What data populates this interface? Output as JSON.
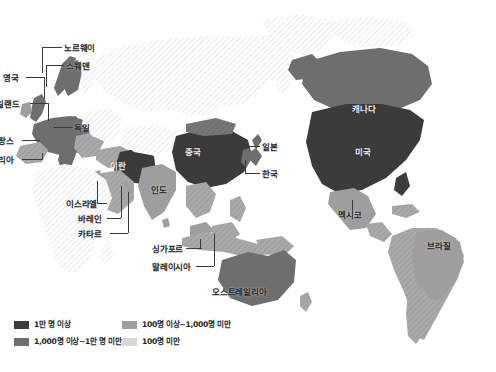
{
  "figure": {
    "type": "choropleth-world-map",
    "background_color": "#ffffff"
  },
  "palette": {
    "tier1": "#3b3b3b",
    "tier2": "#6e6e6e",
    "tier3": "#9e9e9e",
    "tier4": "#d8d8d8",
    "ocean": "#ffffff",
    "label_text": "#222222",
    "leader_line": "#3a3a3a"
  },
  "legend": {
    "items": [
      {
        "label": "1만 명 이상",
        "color": "#3b3b3b",
        "swatch_name": "legend-swatch-tier1"
      },
      {
        "label": "100명 이상~1,000명 미만",
        "color": "#9e9e9e",
        "swatch_name": "legend-swatch-tier3"
      },
      {
        "label": "1,000명 이상~1만 명 미만",
        "color": "#6e6e6e",
        "swatch_name": "legend-swatch-tier2"
      },
      {
        "label": "100명 미만",
        "color": "#d8d8d8",
        "swatch_name": "legend-swatch-tier4"
      }
    ]
  },
  "labels": [
    {
      "id": "norway",
      "text": "노르웨이",
      "x": 64,
      "y": 44,
      "style": "plain"
    },
    {
      "id": "sweden",
      "text": "스웨덴",
      "x": 66,
      "y": 62,
      "style": "plain"
    },
    {
      "id": "uk",
      "text": "영국",
      "x": 3,
      "y": 74,
      "style": "plain"
    },
    {
      "id": "ireland",
      "text": "일랜드",
      "x": -4,
      "y": 100,
      "style": "plain"
    },
    {
      "id": "germany",
      "text": "독일",
      "x": 74,
      "y": 124,
      "style": "plain"
    },
    {
      "id": "france",
      "text": "랑스",
      "x": -2,
      "y": 137,
      "style": "plain"
    },
    {
      "id": "italy",
      "text": "리아",
      "x": -2,
      "y": 156,
      "style": "plain"
    },
    {
      "id": "iran",
      "text": "이란",
      "x": 110,
      "y": 162,
      "style": "on-dark"
    },
    {
      "id": "china",
      "text": "중국",
      "x": 185,
      "y": 148,
      "style": "on-dark"
    },
    {
      "id": "japan",
      "text": "일본",
      "x": 262,
      "y": 143,
      "style": "plain"
    },
    {
      "id": "korea",
      "text": "한국",
      "x": 262,
      "y": 170,
      "style": "plain"
    },
    {
      "id": "india",
      "text": "인도",
      "x": 151,
      "y": 186,
      "style": "plain"
    },
    {
      "id": "israel",
      "text": "이스라엘",
      "x": 66,
      "y": 200,
      "style": "plain"
    },
    {
      "id": "bahrain",
      "text": "바레인",
      "x": 78,
      "y": 215,
      "style": "plain"
    },
    {
      "id": "qatar",
      "text": "카타르",
      "x": 78,
      "y": 230,
      "style": "plain"
    },
    {
      "id": "singapore",
      "text": "싱가포르",
      "x": 152,
      "y": 245,
      "style": "plain"
    },
    {
      "id": "malaysia",
      "text": "말레이시아",
      "x": 152,
      "y": 263,
      "style": "plain"
    },
    {
      "id": "australia",
      "text": "오스트레일리아",
      "x": 212,
      "y": 288,
      "style": "plain"
    },
    {
      "id": "canada",
      "text": "캐나다",
      "x": 352,
      "y": 105,
      "style": "on-dark"
    },
    {
      "id": "usa",
      "text": "미국",
      "x": 355,
      "y": 148,
      "style": "on-dark"
    },
    {
      "id": "mexico",
      "text": "멕시코",
      "x": 338,
      "y": 211,
      "style": "plain"
    },
    {
      "id": "brazil",
      "text": "브라질",
      "x": 427,
      "y": 242,
      "style": "plain"
    }
  ],
  "chart_data": {
    "type": "heatmap",
    "title": "",
    "categories": [
      "1만 명 이상",
      "1,000명 이상~1만 명 미만",
      "100명 이상~1,000명 미만",
      "100명 미만"
    ],
    "values": [
      4,
      3,
      2,
      1
    ],
    "legend_position": "bottom-left",
    "grid": false,
    "regions": [
      {
        "name": "미국",
        "tier": 1
      },
      {
        "name": "중국",
        "tier": 1
      },
      {
        "name": "캐나다",
        "tier": 2
      },
      {
        "name": "이란",
        "tier": 1
      },
      {
        "name": "독일",
        "tier": 2
      },
      {
        "name": "영국",
        "tier": 2
      },
      {
        "name": "프랑스",
        "tier": 2
      },
      {
        "name": "이탈리아",
        "tier": 2
      },
      {
        "name": "아일랜드",
        "tier": 3
      },
      {
        "name": "노르웨이",
        "tier": 2
      },
      {
        "name": "스웨덴",
        "tier": 2
      },
      {
        "name": "일본",
        "tier": 2
      },
      {
        "name": "한국",
        "tier": 2
      },
      {
        "name": "인도",
        "tier": 3
      },
      {
        "name": "이스라엘",
        "tier": 3
      },
      {
        "name": "바레인",
        "tier": 3
      },
      {
        "name": "카타르",
        "tier": 3
      },
      {
        "name": "싱가포르",
        "tier": 2
      },
      {
        "name": "말레이시아",
        "tier": 3
      },
      {
        "name": "오스트레일리아",
        "tier": 2
      },
      {
        "name": "멕시코",
        "tier": 3
      },
      {
        "name": "브라질",
        "tier": 3
      }
    ]
  }
}
